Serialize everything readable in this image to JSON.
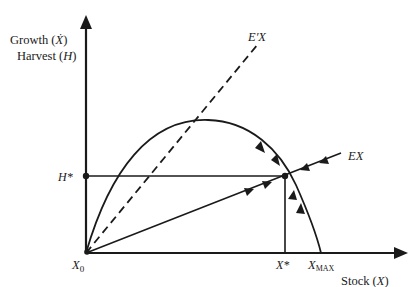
{
  "diagram": {
    "type": "fishery bioeconomic growth-harvest diagram",
    "y_axis": {
      "label_line1": "Growth (Ẋ)",
      "label_line1_prefix": "Growth (",
      "label_line1_var": "Ẋ",
      "label_line1_suffix": ")",
      "label_line2_prefix": "Harvest (",
      "label_line2_var": "H",
      "label_line2_suffix": ")"
    },
    "x_axis": {
      "label_prefix": "Stock (",
      "label_var": "X",
      "label_suffix": ")"
    },
    "points": {
      "origin": "X₀",
      "origin_base": "X",
      "origin_sub": "0",
      "equilibrium_stock": "X*",
      "max_stock_base": "X",
      "max_stock_sub": "MAX",
      "equilibrium_harvest": "H*"
    },
    "curves": {
      "growth_curve": "logistic growth curve from X₀ to X_MAX",
      "effort_line_dashed": "E′X",
      "effort_line_solid": "EX"
    },
    "labels": {
      "dashed_line": "E′X",
      "solid_line": "EX",
      "h_star": "H*",
      "x_star": "X*"
    },
    "colors": {
      "ink": "#1a1a1a",
      "background": "#ffffff"
    }
  }
}
